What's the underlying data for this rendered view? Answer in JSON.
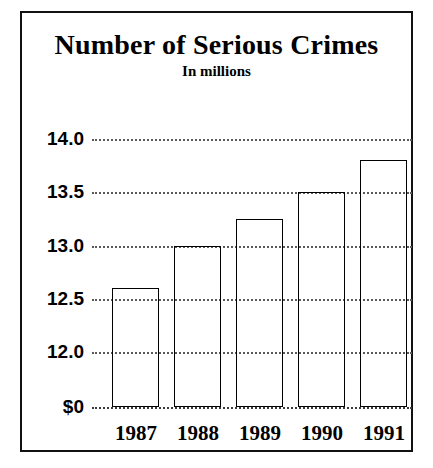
{
  "chart_data": {
    "type": "bar",
    "title": "Number of Serious Crimes",
    "subtitle": "In millions",
    "xlabel": "",
    "ylabel": "",
    "categories": [
      "1987",
      "1988",
      "1989",
      "1990",
      "1991"
    ],
    "values": [
      12.6,
      13.0,
      13.25,
      13.5,
      13.8
    ],
    "ytick_labels": [
      "14.0",
      "13.5",
      "13.0",
      "12.5",
      "12.0",
      "$0"
    ],
    "ytick_values": [
      14.0,
      13.5,
      13.0,
      12.5,
      12.0,
      0
    ],
    "ylim": [
      11.95,
      14.0
    ],
    "grid": true,
    "legend": false,
    "legend_position": "none",
    "bar_style": "cylindrical-gradient",
    "colors": {
      "background": "#ffffff",
      "border": "#111111",
      "text": "#000000",
      "gridline": "#5a5a5a",
      "bar_dark": "#0c0c0c",
      "bar_highlight": "#ffffff"
    }
  }
}
